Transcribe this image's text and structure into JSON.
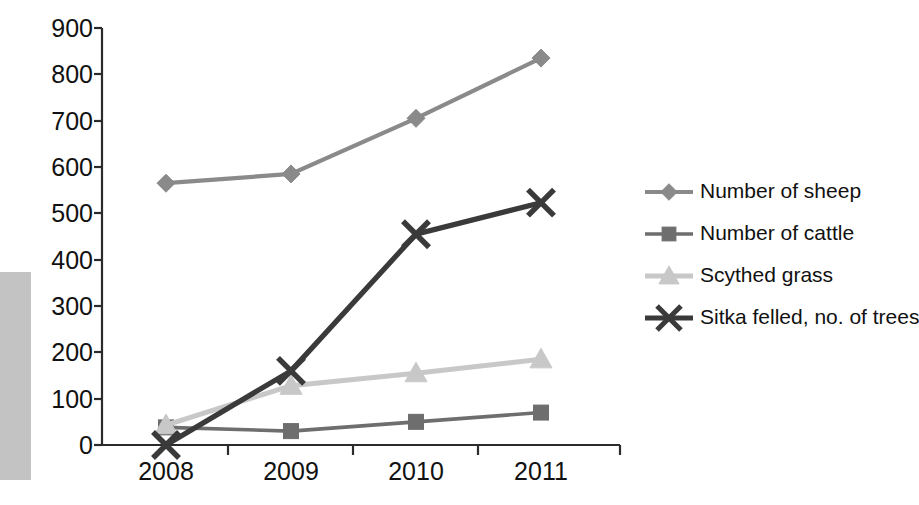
{
  "chart_data": {
    "type": "line",
    "title": "",
    "subtitle": "",
    "xlabel": "",
    "ylabel": "",
    "categories": [
      "2008",
      "2009",
      "2010",
      "2011"
    ],
    "ylim": [
      0,
      900
    ],
    "ytick_values": [
      0,
      100,
      200,
      300,
      400,
      500,
      600,
      700,
      800,
      900
    ],
    "ytick_labels": [
      "0",
      "100",
      "200",
      "300",
      "400",
      "500",
      "600",
      "700",
      "800",
      "900"
    ],
    "grid": false,
    "legend_position": "right",
    "series": [
      {
        "name": "Number of sheep",
        "marker": "diamond",
        "color": "#8a8a8a",
        "values": [
          565,
          585,
          705,
          835
        ]
      },
      {
        "name": "Number of cattle",
        "marker": "square",
        "color": "#6e6e6e",
        "values": [
          38,
          30,
          50,
          70
        ]
      },
      {
        "name": "Scythed grass",
        "marker": "triangle",
        "color": "#c8c8c8",
        "values": [
          43,
          128,
          155,
          185
        ]
      },
      {
        "name": "Sitka felled, no. of trees",
        "marker": "cross",
        "color": "#3a3a3a",
        "values": [
          0,
          160,
          455,
          523
        ]
      }
    ]
  },
  "legend": {
    "items": [
      {
        "label": "Number of sheep"
      },
      {
        "label": "Number of cattle"
      },
      {
        "label": "Scythed grass"
      },
      {
        "label": "Sitka felled, no. of trees"
      }
    ]
  },
  "axes": {
    "y_labels": [
      "900",
      "800",
      "700",
      "600",
      "500",
      "400",
      "300",
      "200",
      "100",
      "0"
    ],
    "x_labels": [
      "2008",
      "2009",
      "2010",
      "2011"
    ]
  },
  "colors": {
    "sheep": "#8a8a8a",
    "cattle": "#6e6e6e",
    "grass": "#c8c8c8",
    "sitka": "#3a3a3a",
    "axis": "#2b2b2b",
    "text": "#111111",
    "scan_edge": "#c3c3c3"
  }
}
